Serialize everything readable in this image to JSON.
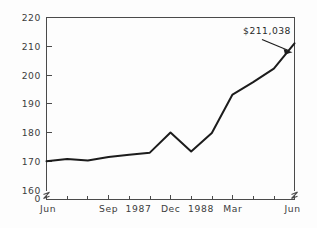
{
  "chart_data": {
    "type": "line",
    "title": "",
    "subtitle": "",
    "xlabel": "",
    "ylabel": "",
    "ylim": [
      160,
      220
    ],
    "y_ticks": [
      160,
      170,
      180,
      190,
      200,
      210,
      220
    ],
    "y_tick_labels": [
      "160",
      "170",
      "180",
      "190",
      "200",
      "210",
      "220"
    ],
    "y_axis_origin_label": "0",
    "y_axis_break": true,
    "x_axis_break": true,
    "grid": false,
    "legend": null,
    "x_tick_labels": [
      "Jun",
      "Sep",
      "1987",
      "Dec",
      "1988",
      "Mar",
      "Jun"
    ],
    "x": [
      "Jun",
      "Jul",
      "Aug",
      "Sep",
      "Oct",
      "Nov",
      "Dec",
      "Jan",
      "Feb",
      "Mar",
      "Apr",
      "May",
      "Jun"
    ],
    "values": [
      170.0,
      170.8,
      170.3,
      171.5,
      172.3,
      173.0,
      180.0,
      173.4,
      179.8,
      193.2,
      197.5,
      202.2,
      211.0
    ],
    "series": [
      {
        "name": "value",
        "values": [
          170.0,
          170.8,
          170.3,
          171.5,
          172.3,
          173.0,
          180.0,
          173.4,
          179.8,
          193.2,
          197.5,
          202.2,
          211.0
        ]
      }
    ],
    "annotations": [
      {
        "text": "$211,038",
        "target_x": "Jun",
        "target_y": 211.0
      }
    ],
    "line_color": "#1c1c1c",
    "axis_color": "#4a4a4a",
    "background_color": "#fdfdfd"
  },
  "axis": {
    "y_labels": {
      "t220": "220",
      "t210": "210",
      "t200": "200",
      "t190": "190",
      "t180": "180",
      "t170": "170",
      "t160": "160",
      "zero": "0"
    },
    "x_labels": {
      "l1": "Jun",
      "l2": "Sep",
      "l3": "1987",
      "l4": "Dec",
      "l5": "1988",
      "l6": "Mar",
      "l7": "Jun"
    }
  },
  "annotation": {
    "value_label": "$211,038"
  }
}
